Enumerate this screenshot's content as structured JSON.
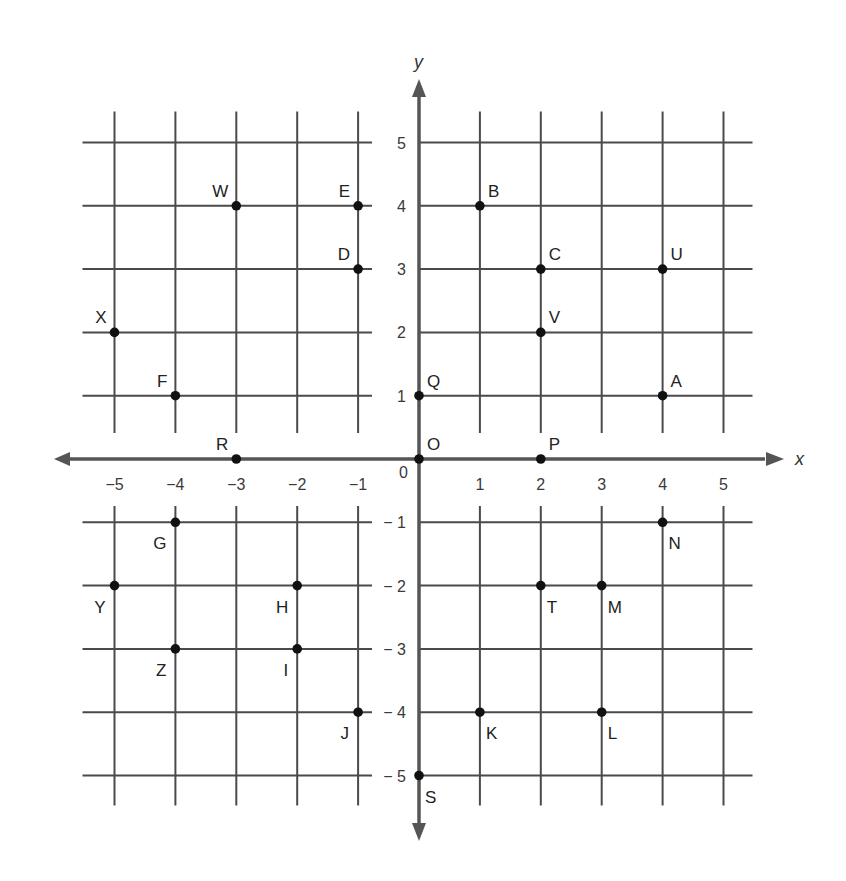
{
  "chart_data": {
    "type": "scatter",
    "title": "",
    "xlabel": "x",
    "ylabel": "y",
    "xlim": [
      -5,
      5
    ],
    "ylim": [
      -5,
      5
    ],
    "grid": true,
    "legend": null,
    "x_ticks": [
      "-5",
      "-4",
      "-3",
      "-2",
      "-1",
      "0",
      "1",
      "2",
      "3",
      "4",
      "5"
    ],
    "y_ticks": [
      "5",
      "4",
      "3",
      "2",
      "1",
      "-1",
      "-2",
      "-3",
      "-4",
      "-5"
    ],
    "origin_label": "0",
    "points": [
      {
        "label": "W",
        "x": -3,
        "y": 4
      },
      {
        "label": "E",
        "x": -1,
        "y": 4
      },
      {
        "label": "B",
        "x": 1,
        "y": 4
      },
      {
        "label": "D",
        "x": -1,
        "y": 3
      },
      {
        "label": "C",
        "x": 2,
        "y": 3
      },
      {
        "label": "U",
        "x": 4,
        "y": 3
      },
      {
        "label": "X",
        "x": -5,
        "y": 2
      },
      {
        "label": "V",
        "x": 2,
        "y": 2
      },
      {
        "label": "F",
        "x": -4,
        "y": 1
      },
      {
        "label": "Q",
        "x": 0,
        "y": 1
      },
      {
        "label": "A",
        "x": 4,
        "y": 1
      },
      {
        "label": "R",
        "x": -3,
        "y": 0
      },
      {
        "label": "O",
        "x": 0,
        "y": 0
      },
      {
        "label": "P",
        "x": 2,
        "y": 0
      },
      {
        "label": "G",
        "x": -4,
        "y": -1
      },
      {
        "label": "N",
        "x": 4,
        "y": -1
      },
      {
        "label": "Y",
        "x": -5,
        "y": -2
      },
      {
        "label": "H",
        "x": -2,
        "y": -2
      },
      {
        "label": "T",
        "x": 2,
        "y": -2
      },
      {
        "label": "M",
        "x": 3,
        "y": -2
      },
      {
        "label": "Z",
        "x": -4,
        "y": -3
      },
      {
        "label": "I",
        "x": -2,
        "y": -3
      },
      {
        "label": "J",
        "x": -1,
        "y": -4
      },
      {
        "label": "K",
        "x": 1,
        "y": -4
      },
      {
        "label": "L",
        "x": 3,
        "y": -4
      },
      {
        "label": "S",
        "x": 0,
        "y": -5
      }
    ]
  },
  "colors": {
    "grid": "#4a4a4a",
    "axis": "#555555",
    "point": "#111111",
    "background": "#ffffff"
  }
}
